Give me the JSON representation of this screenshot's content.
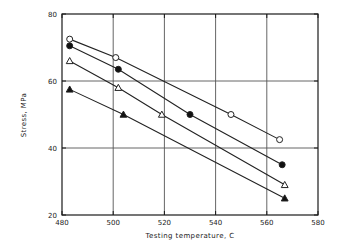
{
  "chart_data": {
    "type": "line",
    "title": "",
    "xlabel": "Testing temperature, C",
    "ylabel": "Stress, MPa",
    "xlim": [
      480,
      580
    ],
    "ylim": [
      20,
      80
    ],
    "xticks": [
      480,
      500,
      520,
      540,
      560,
      580
    ],
    "yticks": [
      20,
      40,
      60,
      80
    ],
    "grid": true,
    "legend": "none",
    "series": [
      {
        "name": "series-open-circle",
        "marker": "open-circle",
        "points": [
          {
            "x": 483,
            "y": 72.5
          },
          {
            "x": 501,
            "y": 67.0
          },
          {
            "x": 546,
            "y": 50.0
          },
          {
            "x": 565,
            "y": 42.5
          }
        ]
      },
      {
        "name": "series-filled-circle",
        "marker": "filled-circle",
        "points": [
          {
            "x": 483,
            "y": 70.5
          },
          {
            "x": 502,
            "y": 63.5
          },
          {
            "x": 530,
            "y": 50.0
          },
          {
            "x": 566,
            "y": 35.0
          }
        ]
      },
      {
        "name": "series-open-triangle",
        "marker": "open-triangle",
        "points": [
          {
            "x": 483,
            "y": 66.0
          },
          {
            "x": 502,
            "y": 58.0
          },
          {
            "x": 519,
            "y": 50.0
          },
          {
            "x": 567,
            "y": 29.0
          }
        ]
      },
      {
        "name": "series-filled-triangle",
        "marker": "filled-triangle",
        "points": [
          {
            "x": 483,
            "y": 57.5
          },
          {
            "x": 504,
            "y": 50.0
          },
          {
            "x": 567,
            "y": 25.0
          }
        ]
      }
    ]
  },
  "axes": {
    "x_tick_labels": [
      "480",
      "500",
      "520",
      "540",
      "560",
      "580"
    ],
    "y_tick_labels": [
      "20",
      "40",
      "60",
      "80"
    ],
    "x_title": "Testing temperature, C",
    "y_title": "Stress, MPa"
  },
  "colors": {
    "frame": "#1a1a1a",
    "grid": "#555555",
    "line": "#222222",
    "marker_fill": "#111111",
    "marker_open": "#ffffff",
    "background": "#ffffff"
  }
}
